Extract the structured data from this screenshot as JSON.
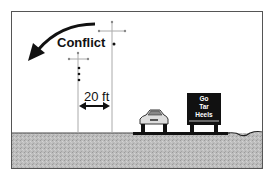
{
  "diagram": {
    "labels": {
      "conflict": "Conflict",
      "distance": "20 ft"
    },
    "sign": {
      "line1": "Go",
      "line2": "Tar",
      "line3": "Heels"
    },
    "elements": [
      "curved-arrow",
      "utility-pole-near",
      "utility-pole-far",
      "dimension-arrow",
      "car",
      "billboard",
      "ground"
    ],
    "colors": {
      "ground": "#b8b8b8",
      "sign": "#111111",
      "pole": "#aaaaaa",
      "arrow": "#111111"
    }
  }
}
